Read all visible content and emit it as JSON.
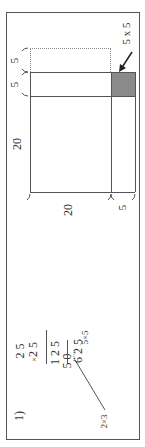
{
  "problem": {
    "number_label": "1)",
    "multiplication": {
      "multiplicand": "2 5",
      "multiplier": "2 5",
      "times_sign": "×",
      "partial_1": "1 2 5",
      "partial_2": "5 0",
      "result": "6 2 5",
      "annotation_right": "5×5",
      "annotation_left": "2×3"
    }
  },
  "diagram": {
    "top_labels": [
      "5",
      "5"
    ],
    "side_label_large": "20",
    "bottom_label_large": "20",
    "bottom_label_small": "5",
    "shaded_label": "5 x 5",
    "shade_color": "#8a8a8a"
  }
}
